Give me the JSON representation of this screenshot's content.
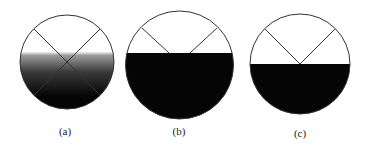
{
  "figure": {
    "panels": [
      {
        "id": "a",
        "label": "(a)",
        "fill": "gradient",
        "description": "Circle with gradient fill from mid-upper level to bottom; two crossing diagonal lines forming an X through the center",
        "cx": 67,
        "cy": 62,
        "r": 47,
        "fill_top_y": 52,
        "lines": "x-cross-through-center"
      },
      {
        "id": "b",
        "label": "(b)",
        "fill": "solid",
        "description": "Circle filled solid black below a horizontal level above center; two lines from upper rim converge toward center, truncated at fill level",
        "cx": 179.5,
        "cy": 65,
        "r": 54,
        "fill_top_y": 53,
        "lines": "v-truncated-at-fill"
      },
      {
        "id": "c",
        "label": "(c)",
        "fill": "solid",
        "description": "Circle filled solid black below the horizontal diameter; two lines from upper rim meet at center forming a V",
        "cx": 300,
        "cy": 64,
        "r": 50,
        "fill_top_y": 64,
        "lines": "v-meeting-at-center"
      }
    ],
    "colors": {
      "outline": "#333333",
      "fill_dark": "#050505",
      "gradient_top": "#f2f2f2",
      "gradient_bottom": "#050505",
      "background": "#ffffff"
    }
  }
}
